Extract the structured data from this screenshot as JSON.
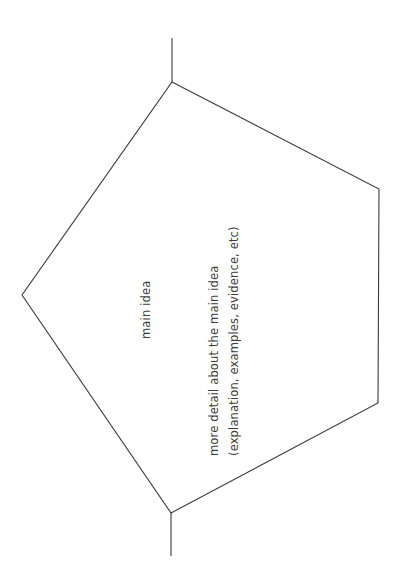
{
  "page": {
    "background_color": "#ffffff",
    "width": 406,
    "height": 585
  },
  "diagram": {
    "type": "graphic-organizer",
    "shape_name": "pentagon-outline",
    "stroke_color": "#3a3a3a",
    "stroke_width": 1,
    "fill": "none",
    "orientation": "text rotated 90 degrees counter-clockwise",
    "vertices": [
      {
        "name": "top-apex",
        "x": 172,
        "y": 82
      },
      {
        "name": "top-right",
        "x": 379,
        "y": 189
      },
      {
        "name": "bottom-right",
        "x": 378,
        "y": 403
      },
      {
        "name": "bottom-apex",
        "x": 171,
        "y": 513
      },
      {
        "name": "left",
        "x": 22,
        "y": 295
      }
    ],
    "stems": [
      {
        "name": "top-stem",
        "x1": 172,
        "y1": 38,
        "x2": 172,
        "y2": 82
      },
      {
        "name": "bottom-stem",
        "x1": 171,
        "y1": 513,
        "x2": 171,
        "y2": 556
      }
    ]
  },
  "labels": {
    "main_idea": "main idea",
    "detail_line1": "more detail about the main idea",
    "detail_line2": "(explanation, examples, evidence, etc)",
    "text_color": "#3c3c3c"
  }
}
